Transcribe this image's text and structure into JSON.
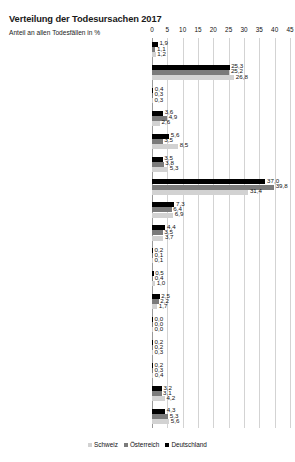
{
  "header": {
    "title": "Verteilung der Todesursachen 2017",
    "subtitle": "Anteil an allen Todesfällen in %"
  },
  "legend": {
    "position": "bottom-center",
    "items": [
      {
        "label": "Schweiz",
        "color": "#d2d2d2",
        "key": "ch"
      },
      {
        "label": "Österreich",
        "color": "#7b7b7b",
        "key": "at"
      },
      {
        "label": "Deutschland",
        "color": "#000000",
        "key": "de"
      }
    ]
  },
  "chart_data": {
    "type": "bar",
    "orientation": "horizontal",
    "title": "Verteilung der Todesursachen 2017",
    "subtitle": "Anteil an allen Todesfällen in %",
    "xlabel": "",
    "ylabel": "",
    "xlim": [
      0,
      45
    ],
    "xticks": [
      0,
      5,
      10,
      15,
      20,
      25,
      30,
      35,
      40,
      45
    ],
    "grid": true,
    "categories": [
      "I Infektiöse/parasitäre K.",
      "II Neubildungen",
      "III Blut, Immunsystem",
      "IV Endokrin, Stoffwechsel",
      "V Psychische und Verh.störungen",
      "VI-VIII Nervensystems, Auge, Ohren",
      "IX Kreislaufsystem",
      "X Atmungssystem",
      "XI Verdauungssystems",
      "XII Haut und Unterhaut",
      "XIII Muskel-Skelett, Bindegewebe",
      "XIV Urogenitalsystem",
      "XV Schwangerschaft, Geburt, W.",
      "XVI K. aus Perinatalperiode",
      "XVII Angeb. Fehlbildungen/Anomalien",
      "XVIII Sonstiges (inkl. Ursache unbek.)",
      "XIX Äußerer Ursachen („nichtnatürlich“)"
    ],
    "series": [
      {
        "name": "Deutschland",
        "color": "#000000",
        "values": [
          1.9,
          25.3,
          0.4,
          3.6,
          5.6,
          3.5,
          37.0,
          7.3,
          4.4,
          0.2,
          0.5,
          2.5,
          0.0,
          0.2,
          0.2,
          3.2,
          4.3
        ],
        "labels": [
          "1,9",
          "25,3",
          "0,4",
          "3,6",
          "5,6",
          "3,5",
          "37,0",
          "7,3",
          "4,4",
          "0,2",
          "0,5",
          "2,5",
          "0,0",
          "0,2",
          "0,2",
          "3,2",
          "4,3"
        ]
      },
      {
        "name": "Österreich",
        "color": "#7b7b7b",
        "values": [
          1.1,
          25.2,
          0.3,
          4.9,
          3.5,
          3.8,
          39.8,
          6.4,
          3.5,
          0.1,
          0.4,
          2.2,
          0.0,
          0.2,
          0.3,
          3.1,
          5.3
        ],
        "labels": [
          "1,1",
          "25,2",
          "0,3",
          "4,9",
          "3,5",
          "3,8",
          "39,8",
          "6,4",
          "3,5",
          "0,1",
          "0,4",
          "2,2",
          "0,0",
          "0,2",
          "0,3",
          "3,1",
          "5,3"
        ]
      },
      {
        "name": "Schweiz",
        "color": "#d2d2d2",
        "values": [
          1.2,
          26.8,
          0.3,
          2.6,
          8.5,
          5.3,
          31.4,
          6.9,
          3.7,
          0.1,
          1.0,
          1.7,
          0.0,
          0.3,
          0.4,
          4.2,
          5.6
        ],
        "labels": [
          "1,2",
          "26,8",
          "0,3",
          "2,6",
          "8,5",
          "5,3",
          "31,4",
          "6,9",
          "3,7",
          "0,1",
          "1,0",
          "1,7",
          "0,0",
          "0,3",
          "0,4",
          "4,2",
          "5,6"
        ]
      }
    ]
  }
}
